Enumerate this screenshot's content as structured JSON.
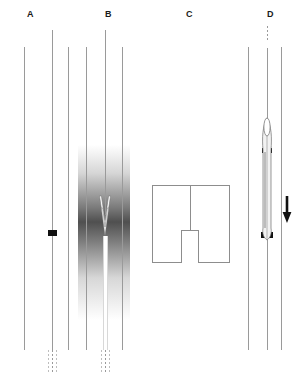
{
  "figure": {
    "width": 299,
    "height": 380,
    "background_color": "#ffffff",
    "line_color": "#9a9a9a",
    "marker_color": "#111111"
  },
  "panels": [
    {
      "id": "A",
      "label": "A",
      "label_x": 27,
      "label_y": 10,
      "description": "Vessel lumen with a guidewire bearing a single radiopaque marker band",
      "vessel_lines": [
        {
          "name": "left-wall",
          "x": 24,
          "y": 47,
          "length": 303
        },
        {
          "name": "center-wire",
          "x": 52,
          "y": 30,
          "length": 320
        },
        {
          "name": "right-wall",
          "x": 68,
          "y": 47,
          "length": 303
        }
      ],
      "marker": {
        "name": "marker-band",
        "x": 48,
        "y": 230,
        "width": 9,
        "height": 6,
        "color": "#111111"
      },
      "dashed_tails": [
        {
          "x": 48,
          "y": 350,
          "length": 24
        },
        {
          "x": 52,
          "y": 350,
          "length": 24
        },
        {
          "x": 56,
          "y": 350,
          "length": 24
        }
      ]
    },
    {
      "id": "B",
      "label": "B",
      "label_x": 105,
      "label_y": 10,
      "description": "Contrast injection shown as a dark diffuse gradient cloud with white chevron flow arrows",
      "vessel_lines": [
        {
          "name": "left-wall",
          "x": 86,
          "y": 47,
          "length": 303
        },
        {
          "name": "center-catheter",
          "x": 105,
          "y": 30,
          "length": 320
        },
        {
          "name": "right-wall",
          "x": 122,
          "y": 47,
          "length": 303
        }
      ],
      "gradient_band": {
        "name": "contrast-cloud",
        "x": 78,
        "y": 145,
        "width": 52,
        "height": 175
      },
      "arrows": {
        "name": "flow-arrows",
        "count": 2,
        "direction": "down",
        "color": "#ffffff"
      },
      "dashed_tails": [
        {
          "x": 101,
          "y": 350,
          "length": 24
        },
        {
          "x": 105,
          "y": 350,
          "length": 24
        },
        {
          "x": 109,
          "y": 350,
          "length": 24
        }
      ]
    },
    {
      "id": "C",
      "label": "C",
      "label_x": 186,
      "label_y": 10,
      "description": "Inset detail box showing the catheter shaft terminating in an open-ended tube",
      "box": {
        "name": "detail-box",
        "x": 152,
        "y": 185,
        "width": 78,
        "height": 78
      },
      "stem": {
        "name": "catheter-stem",
        "x": 190,
        "y": 185,
        "length": 45
      },
      "tube": {
        "name": "open-tube",
        "x": 181,
        "y": 230,
        "width": 18,
        "height": 33
      }
    },
    {
      "id": "D",
      "label": "D",
      "label_x": 267,
      "label_y": 10,
      "description": "Balloon catheter inflated between proximal and distal radiopaque marker bands with a downward advancement arrow",
      "vessel_lines": [
        {
          "name": "left-wall",
          "x": 248,
          "y": 47,
          "length": 303
        },
        {
          "name": "center-shaft",
          "x": 267,
          "y": 40,
          "length": 310
        },
        {
          "name": "right-wall",
          "x": 281,
          "y": 47,
          "length": 303
        }
      ],
      "dashed_top": {
        "name": "dashed-proximal-shaft",
        "x": 267,
        "y": 26,
        "length": 16
      },
      "balloon": {
        "name": "balloon-body",
        "x_center": 267,
        "y_top": 118,
        "y_bottom": 240,
        "max_width": 10
      },
      "markers": [
        {
          "name": "proximal-marker-band",
          "x": 262,
          "y": 148,
          "width": 10,
          "height": 5
        },
        {
          "name": "distal-marker-band",
          "x": 261,
          "y": 232,
          "width": 12,
          "height": 6
        }
      ],
      "arrow": {
        "name": "advance-arrow",
        "direction": "down",
        "x": 287,
        "y_top": 196,
        "y_bottom": 222,
        "color": "#111111"
      }
    }
  ]
}
